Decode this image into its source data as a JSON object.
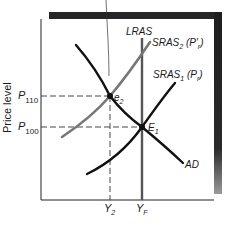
{
  "diagram": {
    "type": "AS-AD economics diagram",
    "y_axis_label": "Price level",
    "price_levels": [
      {
        "symbol": "P",
        "subscript": "110",
        "y": 96
      },
      {
        "symbol": "P",
        "subscript": "100",
        "y": 127
      }
    ],
    "output_levels": [
      {
        "symbol": "Y",
        "subscript": "2",
        "x": 110
      },
      {
        "symbol": "Y",
        "subscript": "F",
        "x": 142
      }
    ],
    "curves": {
      "lras": {
        "label": "LRAS",
        "color": "#555555"
      },
      "sras2": {
        "label": "SRAS",
        "subscript": "2",
        "suffix_open": " (P",
        "suffix_prime": "′",
        "suffix_sub": "r",
        "suffix_close": ")",
        "color": "#777777"
      },
      "sras1": {
        "label": "SRAS",
        "subscript": "1",
        "suffix_open": " (P",
        "suffix_sub": "r",
        "suffix_close": ")",
        "color": "#111111"
      },
      "ad": {
        "label": "AD",
        "color": "#111111"
      }
    },
    "equilibria": [
      {
        "label": "e",
        "subscript": "2"
      },
      {
        "label": "E",
        "subscript": "1"
      }
    ],
    "colors": {
      "shadow": "#2a2a2a",
      "axis": "#222222",
      "dashed": "#333333",
      "background": "#ffffff"
    }
  }
}
